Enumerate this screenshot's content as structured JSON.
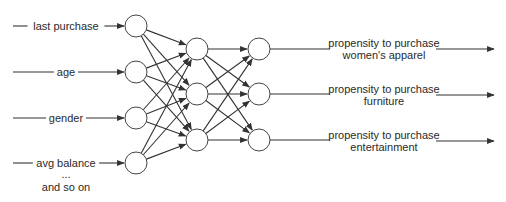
{
  "diagram": {
    "type": "neural-network",
    "colors": {
      "line": "#333333",
      "node_fill": "#ffffff",
      "text": "#2a2a2a",
      "background": "#ffffff"
    },
    "inputs": [
      {
        "label": "last purchase",
        "y": 26
      },
      {
        "label": "age",
        "y": 72
      },
      {
        "label": "gender",
        "y": 118
      },
      {
        "label": "avg balance",
        "y": 163
      }
    ],
    "input_continuation": {
      "ellipsis": "...",
      "label": "and so on"
    },
    "layers": {
      "input": {
        "x": 136,
        "ys": [
          26,
          72,
          118,
          163
        ]
      },
      "hidden1": {
        "x": 197,
        "ys": [
          49,
          94,
          140
        ]
      },
      "hidden2": {
        "x": 259,
        "ys": [
          49,
          94,
          140
        ]
      }
    },
    "node_radius": 11,
    "outputs": [
      {
        "line1": "propensity to purchase",
        "line2": "women's apparel",
        "y": 49
      },
      {
        "line1": "propensity to purchase",
        "line2": "furniture",
        "y": 95
      },
      {
        "line1": "propensity to purchase",
        "line2": "entertainment",
        "y": 141
      }
    ]
  }
}
